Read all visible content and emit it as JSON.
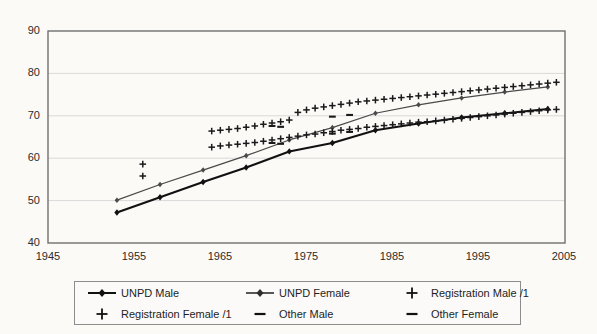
{
  "chart_data": {
    "type": "line",
    "title": "",
    "xlabel": "",
    "ylabel": "",
    "xlim": [
      1945,
      2005
    ],
    "ylim": [
      40,
      90
    ],
    "xticks": [
      1945,
      1955,
      1965,
      1975,
      1985,
      1995,
      2005
    ],
    "yticks": [
      40,
      50,
      60,
      70,
      80,
      90
    ],
    "grid": "horizontal",
    "legend_position": "below-plot",
    "series": [
      {
        "name": "UNPD Male",
        "marker": "diamond",
        "line": "solid-thick-black",
        "color": "#111111",
        "x": [
          1953,
          1958,
          1963,
          1968,
          1973,
          1978,
          1983,
          1988,
          1993,
          1998,
          2003
        ],
        "y": [
          47.2,
          50.8,
          54.4,
          57.8,
          61.6,
          63.6,
          66.6,
          68.2,
          69.6,
          70.6,
          71.6
        ]
      },
      {
        "name": "UNPD Female",
        "marker": "diamond",
        "line": "solid-thin-gray",
        "color": "#4a4a4a",
        "x": [
          1953,
          1958,
          1963,
          1968,
          1973,
          1978,
          1983,
          1988,
          1993,
          1998,
          2003
        ],
        "y": [
          50.1,
          53.8,
          57.2,
          60.6,
          64.3,
          67.2,
          70.6,
          72.6,
          74.2,
          75.6,
          76.8
        ]
      },
      {
        "name": "Registration Male /1",
        "marker": "plus",
        "line": "none",
        "color": "#1a1a1a",
        "x": [
          1956,
          1964,
          1965,
          1966,
          1967,
          1968,
          1969,
          1970,
          1971,
          1972,
          1973,
          1974,
          1975,
          1976,
          1977,
          1978,
          1979,
          1980,
          1981,
          1982,
          1983,
          1984,
          1985,
          1986,
          1987,
          1988,
          1989,
          1990,
          1991,
          1992,
          1993,
          1994,
          1995,
          1996,
          1997,
          1998,
          1999,
          2000,
          2001,
          2002,
          2003,
          2004
        ],
        "y": [
          55.8,
          62.6,
          62.9,
          63.1,
          63.3,
          63.5,
          63.7,
          64.0,
          64.3,
          64.6,
          64.9,
          65.2,
          65.5,
          65.7,
          66.0,
          66.3,
          66.6,
          66.8,
          67.0,
          67.3,
          67.5,
          67.7,
          67.9,
          68.1,
          68.3,
          68.5,
          68.6,
          68.8,
          69.0,
          69.2,
          69.4,
          69.6,
          69.8,
          70.0,
          70.2,
          70.4,
          70.6,
          70.8,
          71.0,
          71.2,
          71.4,
          71.5
        ]
      },
      {
        "name": "Registration Female /1",
        "marker": "plus",
        "line": "none",
        "color": "#1a1a1a",
        "x": [
          1956,
          1964,
          1965,
          1966,
          1967,
          1968,
          1969,
          1970,
          1971,
          1972,
          1973,
          1974,
          1975,
          1976,
          1977,
          1978,
          1979,
          1980,
          1981,
          1982,
          1983,
          1984,
          1985,
          1986,
          1987,
          1988,
          1989,
          1990,
          1991,
          1992,
          1993,
          1994,
          1995,
          1996,
          1997,
          1998,
          1999,
          2000,
          2001,
          2002,
          2003,
          2004
        ],
        "y": [
          58.6,
          66.4,
          66.6,
          66.8,
          67.0,
          67.3,
          67.6,
          68.0,
          68.3,
          68.6,
          69.0,
          70.8,
          71.4,
          71.8,
          72.1,
          72.4,
          72.7,
          73.0,
          73.3,
          73.5,
          73.7,
          73.9,
          74.1,
          74.3,
          74.5,
          74.7,
          74.9,
          75.1,
          75.3,
          75.5,
          75.7,
          75.9,
          76.1,
          76.3,
          76.5,
          76.7,
          76.9,
          77.1,
          77.3,
          77.5,
          77.7,
          77.9
        ]
      },
      {
        "name": "Other Male",
        "marker": "dash",
        "line": "none",
        "color": "#1a1a1a",
        "x": [
          1971,
          1972,
          1978,
          1980
        ],
        "y": [
          63.6,
          63.4,
          65.8,
          66.2
        ]
      },
      {
        "name": "Other Female",
        "marker": "dash",
        "line": "none",
        "color": "#1a1a1a",
        "x": [
          1971,
          1972,
          1978,
          1980
        ],
        "y": [
          67.6,
          67.4,
          69.8,
          70.2
        ]
      }
    ]
  },
  "axes": {
    "y_tick_labels": [
      "90",
      "80",
      "70",
      "60",
      "50",
      "40"
    ],
    "x_tick_labels": [
      "1945",
      "1955",
      "1965",
      "1975",
      "1985",
      "1995",
      "2005"
    ]
  },
  "legend": {
    "items": [
      {
        "label": "UNPD Male",
        "mark": "line-diamond-black"
      },
      {
        "label": "UNPD Female",
        "mark": "line-diamond-gray"
      },
      {
        "label": "Registration Male /1",
        "mark": "plus-marker"
      },
      {
        "label": "Registration Female /1",
        "mark": "plus-marker"
      },
      {
        "label": "Other Male",
        "mark": "dash-marker"
      },
      {
        "label": "Other Female",
        "mark": "dash-marker"
      }
    ]
  },
  "colors": {
    "background": "#fbfaf7",
    "frame": "#6f6f6f",
    "grid": "#d9d9d9",
    "series_dark": "#111111",
    "series_gray": "#4a4a4a",
    "text": "#1e1e1e"
  }
}
